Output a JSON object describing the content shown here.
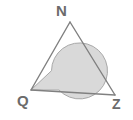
{
  "figure": {
    "type": "geometry-diagram",
    "canvas": {
      "width": 133,
      "height": 120
    },
    "colors": {
      "background": "#ffffff",
      "stroke": "#808080",
      "sector_fill": "#d9d9d9",
      "sector_stroke": "#a8a8a8",
      "label": "#6b6b6b"
    },
    "vertices": [
      {
        "id": "N",
        "label": "N",
        "x": 70,
        "y": 22,
        "label_x": 56,
        "label_y": 3
      },
      {
        "id": "Q",
        "label": "Q",
        "x": 31,
        "y": 90,
        "label_x": 17,
        "label_y": 93
      },
      {
        "id": "Z",
        "label": "Z",
        "x": 115,
        "y": 95,
        "label_x": 112,
        "label_y": 97
      }
    ],
    "edges": [
      {
        "id": "QN",
        "from": "Q",
        "to": "N"
      },
      {
        "id": "NZ",
        "from": "N",
        "to": "Z"
      },
      {
        "id": "QZ",
        "from": "Q",
        "to": "Z"
      }
    ],
    "angle_marker": {
      "at_vertex": "Q",
      "kind": "reflex-angle-sector",
      "center_x": 31,
      "center_y": 90,
      "radius": 28
    }
  }
}
